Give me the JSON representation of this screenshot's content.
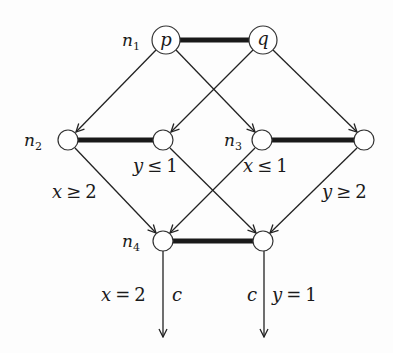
{
  "diagram": {
    "nodes": [
      {
        "id": "p",
        "label": "p",
        "name_label": "n",
        "name_sub": "1"
      },
      {
        "id": "q",
        "label": "q"
      },
      {
        "id": "n2a",
        "name_label": "n",
        "name_sub": "2"
      },
      {
        "id": "n2b"
      },
      {
        "id": "n3a",
        "name_label": "n",
        "name_sub": "3"
      },
      {
        "id": "n3b"
      },
      {
        "id": "n4a",
        "name_label": "n",
        "name_sub": "4"
      },
      {
        "id": "n4b"
      }
    ],
    "edge_labels": {
      "x_ge_2": {
        "var": "x",
        "op": "≥",
        "val": "2"
      },
      "y_le_1": {
        "var": "y",
        "op": "≤",
        "val": "1"
      },
      "x_le_1": {
        "var": "x",
        "op": "≤",
        "val": "1"
      },
      "y_ge_2": {
        "var": "y",
        "op": "≥",
        "val": "2"
      },
      "x_eq_2": {
        "var": "x",
        "op": "=",
        "val": "2"
      },
      "y_eq_1": {
        "var": "y",
        "op": "=",
        "val": "1"
      },
      "c_left": "c",
      "c_right": "c"
    },
    "colors": {
      "stroke": "#222222",
      "thick": "#1a1a1a",
      "node_fill": "#ffffff"
    }
  }
}
